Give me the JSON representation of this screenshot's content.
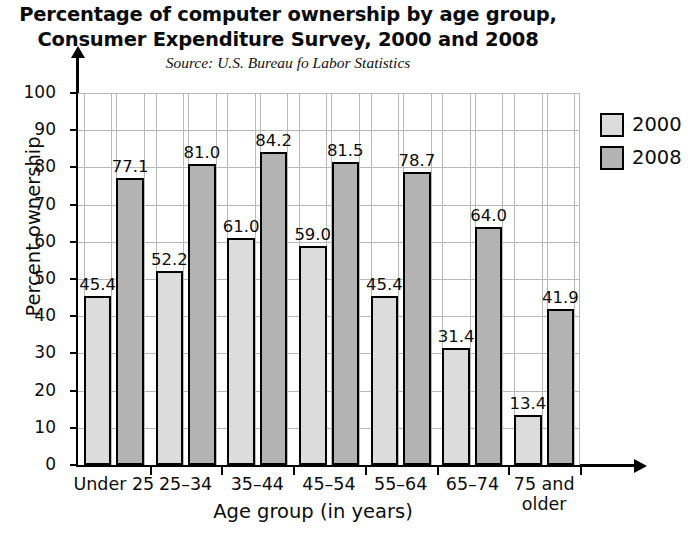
{
  "chart_data": {
    "type": "bar",
    "title": "Percentage of computer ownership by age group, Consumer Expenditure Survey, 2000 and 2008",
    "title_line1": "Percentage of computer ownership by age group,",
    "title_line2": "Consumer Expenditure Survey, 2000 and 2008",
    "subtitle": "Source: U.S. Bureau fo Labor Statistics",
    "xlabel": "Age group (in years)",
    "ylabel": "Percent ownership",
    "ylim": [
      0,
      100
    ],
    "ytick_values": [
      0,
      10,
      20,
      30,
      40,
      50,
      60,
      70,
      80,
      90,
      100
    ],
    "ytick_labels": [
      "0",
      "10",
      "20",
      "30",
      "40",
      "50",
      "60",
      "70",
      "80",
      "90",
      "100"
    ],
    "grid": "both",
    "legend_position": "right",
    "categories": [
      "Under 25",
      "25–34",
      "35–44",
      "45–54",
      "55–64",
      "65–74",
      "75 and older"
    ],
    "category_lines": [
      [
        "Under 25"
      ],
      [
        "25–34"
      ],
      [
        "35–44"
      ],
      [
        "45–54"
      ],
      [
        "55–64"
      ],
      [
        "65–74"
      ],
      [
        "75 and",
        "older"
      ]
    ],
    "series": [
      {
        "name": "2000",
        "color": "#dcdcdc",
        "values": [
          45.4,
          52.2,
          61.0,
          59.0,
          45.4,
          31.4,
          13.4
        ],
        "value_labels": [
          "45.4",
          "52.2",
          "61.0",
          "59.0",
          "45.4",
          "31.4",
          "13.4"
        ]
      },
      {
        "name": "2008",
        "color": "#b3b3b3",
        "values": [
          77.1,
          81.0,
          84.2,
          81.5,
          78.7,
          64.0,
          41.9
        ],
        "value_labels": [
          "77.1",
          "81.0",
          "84.2",
          "81.5",
          "78.7",
          "64.0",
          "41.9"
        ]
      }
    ]
  },
  "legend": {
    "entries": [
      {
        "label": "2000",
        "color": "#dcdcdc"
      },
      {
        "label": "2008",
        "color": "#b3b3b3"
      }
    ]
  }
}
